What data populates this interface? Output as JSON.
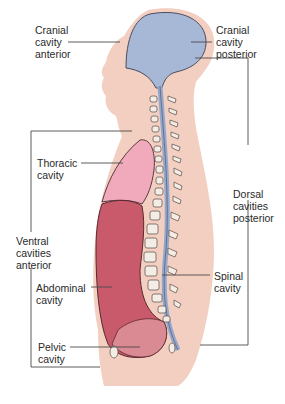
{
  "figure": {
    "type": "anatomical-diagram"
  },
  "labels": {
    "cranial_anterior": "Cranial\ncavity\nanterior",
    "cranial_posterior": "Cranial\ncavity\nposterior",
    "thoracic": "Thoracic\ncavity",
    "ventral": "Ventral\ncavities\nanterior",
    "abdominal": "Abdominal\ncavity",
    "pelvic": "Pelvic\ncavity",
    "dorsal": "Dorsal\ncavities\nposterior",
    "spinal": "Spinal\ncavity"
  },
  "colors": {
    "skin": "#f2cfc0",
    "brain_cavity": "#9fb3d3",
    "thoracic": "#f0a9bb",
    "abdominal": "#c85a6c",
    "vertebra": "#f4ede6",
    "line": "#4a4a4a"
  }
}
